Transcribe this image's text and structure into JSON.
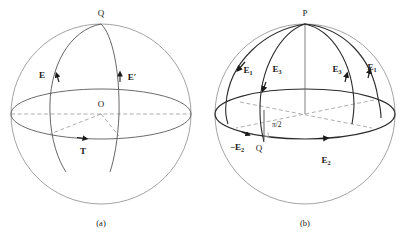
{
  "figure": {
    "width": 403,
    "height": 239,
    "background": "#ffffff",
    "outline_color": "#8c8c8c",
    "arc_color": "#2b2b2b",
    "dash_color": "#9a9a9a",
    "label_color": "#1a1a1a"
  },
  "panel_a": {
    "caption": "(a)",
    "sphere": {
      "cx": 101,
      "cy": 114,
      "r": 90,
      "equator_ry": 25
    },
    "labels": {
      "pole": "Q",
      "center": "O",
      "vector_e": "E",
      "vector_e_prime": "E′",
      "tangent": "T"
    }
  },
  "panel_b": {
    "caption": "(b)",
    "sphere": {
      "cx": 305,
      "cy": 114,
      "r": 90,
      "equator_ry": 25
    },
    "labels": {
      "pole": "P",
      "origin": "Q",
      "angle": "π/2",
      "arc_left_outer": {
        "base": "E",
        "sub": "1"
      },
      "arc_left_inner": {
        "base": "E",
        "sub": "3"
      },
      "arc_right_inner": {
        "base": "E",
        "sub": "3"
      },
      "arc_right_outer": {
        "base": "E",
        "sub": "1"
      },
      "equator_left": {
        "base": "−E",
        "sub": "2"
      },
      "equator_right": {
        "base": "E",
        "sub": "2"
      }
    }
  }
}
